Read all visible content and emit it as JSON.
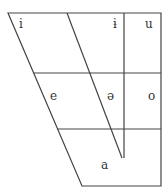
{
  "chart": {
    "type": "vowel-trapezoid",
    "line_color": "#444444",
    "vowels": [
      {
        "symbol": "i",
        "position": "close-front"
      },
      {
        "symbol": "ɨ",
        "position": "close-central"
      },
      {
        "symbol": "u",
        "position": "close-back"
      },
      {
        "symbol": "e",
        "position": "mid-front"
      },
      {
        "symbol": "ə",
        "position": "mid-central"
      },
      {
        "symbol": "o",
        "position": "mid-back"
      },
      {
        "symbol": "a",
        "position": "open-central"
      }
    ]
  }
}
